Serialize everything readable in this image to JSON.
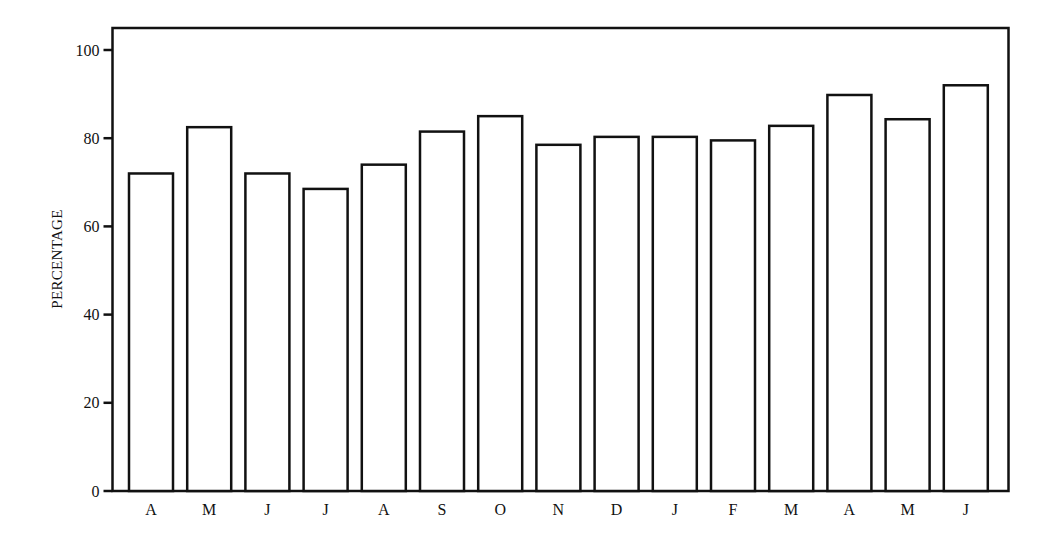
{
  "chart_data": {
    "type": "bar",
    "title": "",
    "xlabel": "",
    "ylabel": "PERCENTAGE",
    "ylim": [
      0,
      100
    ],
    "yticks": [
      0,
      20,
      40,
      60,
      80,
      100
    ],
    "grid": false,
    "legend": null,
    "categories": [
      "A",
      "M",
      "J",
      "J",
      "A",
      "S",
      "O",
      "N",
      "D",
      "J",
      "F",
      "M",
      "A",
      "M",
      "J"
    ],
    "values": [
      72,
      82.5,
      72,
      68.5,
      74,
      81.5,
      85,
      78.5,
      80.3,
      80.3,
      79.5,
      82.8,
      89.8,
      84.3,
      92
    ],
    "bar_fill": "#ffffff",
    "bar_stroke": "#111111"
  }
}
